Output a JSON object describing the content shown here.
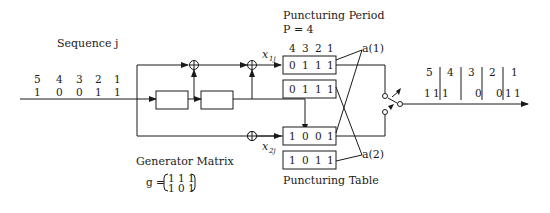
{
  "input": {
    "label": "Sequence j",
    "indices": [
      "5",
      "4",
      "3",
      "2",
      "1"
    ],
    "bits": [
      "1",
      "0",
      "0",
      "1",
      "1"
    ]
  },
  "encoder": {
    "register_count": 2,
    "output1_label": "x",
    "output1_sub": "1j",
    "output2_label": "x",
    "output2_sub": "2j"
  },
  "generator_matrix": {
    "label": "Generator Matrix",
    "symbol": "g =",
    "row1": "1 1 1",
    "row2": "1 0 1"
  },
  "puncturing": {
    "period_label": "Puncturing Period",
    "period_value": "P = 4",
    "column_indices": [
      "4",
      "3",
      "2",
      "1"
    ],
    "table_label": "Puncturing Table",
    "a1_label": "a(1)",
    "a2_label": "a(2)",
    "rows": [
      {
        "name": "a1-row1",
        "bits": [
          "0",
          "1",
          "1",
          "1"
        ]
      },
      {
        "name": "a1-row2",
        "bits": [
          "0",
          "1",
          "1",
          "1"
        ]
      },
      {
        "name": "a2-row1",
        "bits": [
          "1",
          "0",
          "0",
          "1"
        ]
      },
      {
        "name": "a2-row2",
        "bits": [
          "1",
          "0",
          "1",
          "1"
        ]
      }
    ]
  },
  "output": {
    "indices": [
      "5",
      "4",
      "3",
      "2",
      "1"
    ],
    "bits": [
      {
        "left": "1",
        "right": "1"
      },
      {
        "left": "1",
        "right": ""
      },
      {
        "left": "",
        "right": "0"
      },
      {
        "left": "",
        "right": "0"
      },
      {
        "left": "1",
        "right": "1"
      }
    ]
  }
}
